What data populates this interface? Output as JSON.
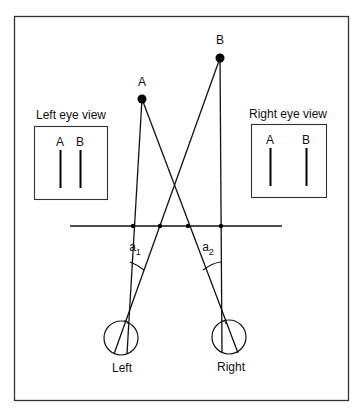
{
  "diagram": {
    "points": {
      "a_label": "A",
      "b_label": "B"
    },
    "left_eye_view": {
      "title": "Left eye view",
      "a_label": "A",
      "b_label": "B"
    },
    "right_eye_view": {
      "title": "Right eye view",
      "a_label": "A",
      "b_label": "B"
    },
    "angles": {
      "a1_base": "a",
      "a1_sub": "1",
      "a2_base": "a",
      "a2_sub": "2"
    },
    "eyes": {
      "left_label": "Left",
      "right_label": "Right"
    }
  }
}
